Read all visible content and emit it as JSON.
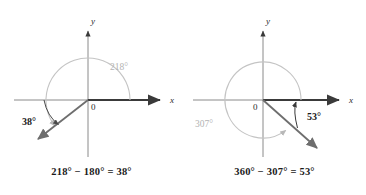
{
  "figure": {
    "panels": [
      {
        "id": "panel-left",
        "caption": "218° − 180° = 38°",
        "axis_x_label": "x",
        "axis_y_label": "y",
        "origin_label": "0",
        "rotation_angle_label": "218°",
        "reference_angle_label": "38°",
        "rotation_degrees": 218,
        "reference_degrees": 38,
        "rotation_direction": "counterclockwise",
        "terminal_ray_quadrant": 3
      },
      {
        "id": "panel-right",
        "caption": "360° − 307° = 53°",
        "axis_x_label": "x",
        "axis_y_label": "y",
        "origin_label": "0",
        "rotation_angle_label": "307°",
        "reference_angle_label": "53°",
        "rotation_degrees": 307,
        "reference_degrees": 53,
        "rotation_direction": "counterclockwise",
        "terminal_ray_quadrant": 4
      }
    ]
  },
  "colors": {
    "background": "#ffffff",
    "axis": "#8a8a8a",
    "terminal_ray": "#6e6e6e",
    "bold_axis": "#3a3a3a",
    "rotation_arc": "#c4c4c4",
    "reference_arc": "#4a4a4a",
    "rotation_label": "#b3b3b3",
    "reference_label": "#1a1a1a",
    "caption_text": "#1a1a1a"
  }
}
